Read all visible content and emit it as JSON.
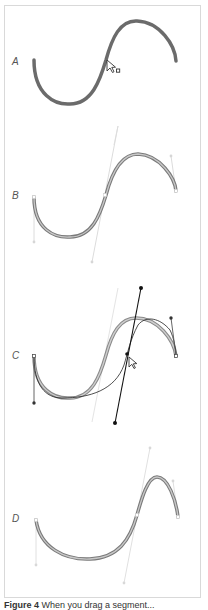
{
  "figure": {
    "panels": [
      {
        "id": "A",
        "label": "A",
        "description": "Path selected, cursor hovering over curve segment with direct-selection pointer"
      },
      {
        "id": "B",
        "label": "B",
        "description": "Segment selected showing direction handles"
      },
      {
        "id": "C",
        "label": "C",
        "description": "Dragging the segment; direction handle moves and preview curve is shown"
      },
      {
        "id": "D",
        "label": "D",
        "description": "Resulting reshaped curve after drag"
      }
    ],
    "caption": {
      "prefix": "Figure 4",
      "text": "When you drag a segment..."
    }
  },
  "colors": {
    "frame_border": "#d9d9d9",
    "path_stroke": "#6b6b6b",
    "path_highlight": "#bdbdbd",
    "handle_light": "#d6d6d6",
    "handle_dark": "#222222",
    "label": "#555555"
  }
}
